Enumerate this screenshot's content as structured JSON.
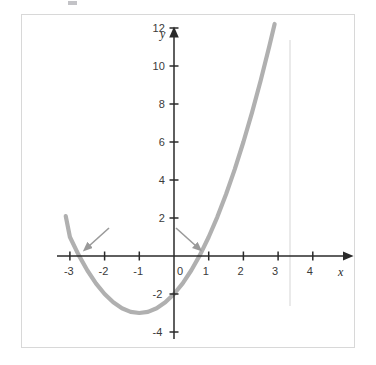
{
  "figure": {
    "background_color": "#ffffff",
    "frame_border_color": "#d8d8d8",
    "axis_color": "#2a2a2a",
    "curve_color": "#b0b0b0",
    "arrow_color": "#9a9a9a",
    "guide_line_color": "#dcdcdc",
    "x_axis_name": "x",
    "y_axis_name": "y"
  },
  "chart_data": {
    "type": "line",
    "title": "",
    "subtitle": "",
    "xlabel": "x",
    "ylabel": "y",
    "xlim": [
      -3.45,
      5.0
    ],
    "ylim": [
      -4.95,
      13.2
    ],
    "grid": false,
    "legend": null,
    "axis_style": "arrow-tipped cartesian axes through origin",
    "x_ticks": [
      -3,
      -2,
      -1,
      0,
      1,
      2,
      3,
      4
    ],
    "x_tick_labels": [
      "-3",
      "-2",
      "-1",
      "0",
      "1",
      "2",
      "3",
      "4"
    ],
    "y_ticks": [
      -4,
      -2,
      2,
      4,
      6,
      8,
      10,
      12
    ],
    "y_tick_labels": [
      "-4",
      "-2",
      "2",
      "4",
      "6",
      "8",
      "10",
      "12"
    ],
    "series": [
      {
        "name": "parabola",
        "type": "curve",
        "equation": "y = x^2 + 2x - 2",
        "color": "#b0b0b0",
        "line_width": 4,
        "x_domain": [
          -3.12,
          2.9
        ],
        "vertex": [
          -1.0,
          -3.0
        ],
        "x_intercepts": [
          -2.73,
          0.73
        ],
        "y_intercept": -2,
        "points": [
          [
            -3.12,
            2.1
          ],
          [
            -3.0,
            1.0
          ],
          [
            -2.75,
            0.06
          ],
          [
            -2.5,
            -0.75
          ],
          [
            -2.25,
            -1.44
          ],
          [
            -2.0,
            -2.0
          ],
          [
            -1.75,
            -2.44
          ],
          [
            -1.5,
            -2.75
          ],
          [
            -1.25,
            -2.94
          ],
          [
            -1.0,
            -3.0
          ],
          [
            -0.75,
            -2.94
          ],
          [
            -0.5,
            -2.75
          ],
          [
            -0.25,
            -2.44
          ],
          [
            0.0,
            -2.0
          ],
          [
            0.25,
            -1.44
          ],
          [
            0.5,
            -0.75
          ],
          [
            0.75,
            0.06
          ],
          [
            1.0,
            1.0
          ],
          [
            1.25,
            2.06
          ],
          [
            1.5,
            3.25
          ],
          [
            1.75,
            4.56
          ],
          [
            2.0,
            6.0
          ],
          [
            2.25,
            7.56
          ],
          [
            2.5,
            9.25
          ],
          [
            2.75,
            11.06
          ],
          [
            2.9,
            12.21
          ]
        ]
      }
    ],
    "annotations": [
      {
        "name": "left-root-arrow",
        "type": "arrow",
        "color": "#9a9a9a",
        "from": [
          -1.85,
          1.45
        ],
        "to": [
          -2.52,
          0.52
        ],
        "points_at": "left x-intercept"
      },
      {
        "name": "right-root-arrow",
        "type": "arrow",
        "color": "#9a9a9a",
        "from": [
          0.05,
          1.45
        ],
        "to": [
          0.62,
          0.5
        ],
        "points_at": "right x-intercept"
      },
      {
        "name": "vertical-guide-line",
        "type": "vline",
        "color": "#dcdcdc",
        "x": 3.35,
        "y_from": -2.6,
        "y_to": 11.4
      }
    ]
  }
}
